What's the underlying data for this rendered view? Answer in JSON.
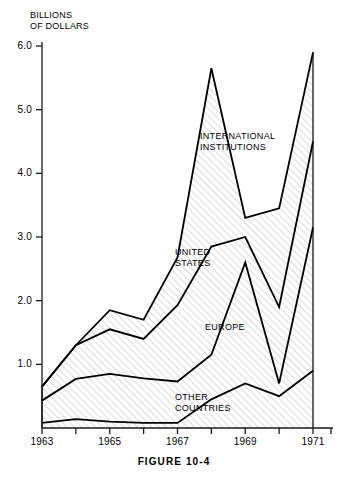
{
  "caption": "FIGURE 10-4",
  "chart_data": {
    "type": "area",
    "title": "",
    "subtitle": "",
    "ylabel": "BILLIONS\nOF DOLLARS",
    "xlabel": "",
    "stacked": true,
    "grid": false,
    "legend_position": "inline-annotations",
    "ylim": [
      0,
      6.2
    ],
    "xlim": [
      1963,
      1971
    ],
    "yticks": [
      "1.0",
      "2.0",
      "3.0",
      "4.0",
      "5.0",
      "6.0"
    ],
    "ytick_values": [
      1.0,
      2.0,
      3.0,
      4.0,
      5.0,
      6.0
    ],
    "xticks": [
      "1963",
      "1965",
      "1967",
      "1969",
      "1971"
    ],
    "xtick_values": [
      1963,
      1965,
      1967,
      1969,
      1971
    ],
    "x_minor_ticks": [
      1964,
      1966,
      1968,
      1970
    ],
    "x": [
      1963,
      1964,
      1965,
      1966,
      1967,
      1968,
      1969,
      1970,
      1971
    ],
    "series": [
      {
        "name": "OTHER COUNTRIES",
        "label": "OTHER\nCOUNTRIES",
        "values": [
          0.08,
          0.14,
          0.1,
          0.08,
          0.08,
          0.45,
          0.7,
          0.5,
          0.9
        ]
      },
      {
        "name": "EUROPE",
        "label": "EUROPE",
        "values": [
          0.35,
          0.63,
          0.75,
          0.7,
          0.65,
          0.7,
          1.9,
          0.2,
          2.25
        ]
      },
      {
        "name": "UNITED STATES",
        "label": "UNITED\nSTATES",
        "values": [
          0.22,
          0.53,
          0.7,
          0.62,
          1.2,
          1.7,
          0.4,
          1.2,
          1.35
        ]
      },
      {
        "name": "INTERNATIONAL INSTITUTIONS",
        "label": "INTERNATIONAL\nINSTITUTIONS",
        "values": [
          0.0,
          0.0,
          0.3,
          0.3,
          0.75,
          2.8,
          0.3,
          1.55,
          1.4
        ]
      }
    ],
    "cumulative_tops": {
      "other_countries": [
        0.08,
        0.14,
        0.1,
        0.08,
        0.08,
        0.45,
        0.7,
        0.5,
        0.9
      ],
      "europe": [
        0.43,
        0.77,
        0.85,
        0.78,
        0.73,
        1.15,
        2.6,
        0.7,
        3.15
      ],
      "united_states": [
        0.65,
        1.3,
        1.55,
        1.4,
        1.93,
        2.85,
        3.0,
        1.9,
        4.5
      ],
      "international_institutions": [
        0.65,
        1.3,
        1.85,
        1.7,
        2.68,
        5.65,
        3.3,
        3.45,
        5.9
      ]
    },
    "colors": {
      "line": "#000000",
      "hatch": "#b8b8b8",
      "background": "#ffffff",
      "axis": "#1a1a1a"
    }
  },
  "annotations": {
    "international_institutions": "INTERNATIONAL\nINSTITUTIONS",
    "united_states": "UNITED\nSTATES",
    "europe": "EUROPE",
    "other_countries": "OTHER\nCOUNTRIES"
  }
}
